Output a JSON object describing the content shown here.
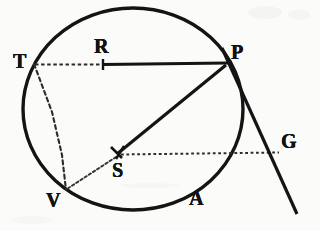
{
  "figure": {
    "kind": "geometry-diagram",
    "caption_text": "",
    "background_color": "#fbfbfa",
    "ink_color": "#121212",
    "canvas": {
      "width": 320,
      "height": 231
    }
  },
  "circle": {
    "name": "main-circle",
    "center_x": 133,
    "center_y": 109,
    "radius_x": 110,
    "radius_y": 101,
    "stroke_width": 3.4,
    "stroke_color": "#141414"
  },
  "points": [
    {
      "id": "T",
      "label": "T",
      "x": 34,
      "y": 64,
      "label_x": 13,
      "label_y": 51,
      "font_size": 20,
      "on_circle": true
    },
    {
      "id": "R",
      "label": "R",
      "x": 103,
      "y": 64,
      "label_x": 94,
      "label_y": 36,
      "font_size": 20,
      "on_circle": false
    },
    {
      "id": "P",
      "label": "P",
      "x": 227,
      "y": 64,
      "label_x": 231,
      "label_y": 42,
      "font_size": 20,
      "on_circle": true
    },
    {
      "id": "S",
      "label": "S",
      "x": 118,
      "y": 155,
      "label_x": 112,
      "label_y": 160,
      "font_size": 20,
      "on_circle": false
    },
    {
      "id": "V",
      "label": "V",
      "x": 66,
      "y": 190,
      "label_x": 46,
      "label_y": 190,
      "font_size": 20,
      "on_circle": true
    },
    {
      "id": "A",
      "label": "A",
      "x": 190,
      "y": 205,
      "label_x": 189,
      "label_y": 188,
      "font_size": 20,
      "on_circle": false
    },
    {
      "id": "G",
      "label": "G",
      "x": 278,
      "y": 152,
      "label_x": 281,
      "label_y": 131,
      "font_size": 20,
      "on_circle": false
    }
  ],
  "segments": [
    {
      "name": "segment-T-R",
      "from": "T",
      "to": "R",
      "style": "dotted",
      "width": 2.0,
      "note": "dotted chord portion from T to tick R"
    },
    {
      "name": "segment-R-P",
      "from": "R",
      "to": "P",
      "style": "solid",
      "width": 3.2,
      "note": "solid heavy line from R to P"
    },
    {
      "name": "segment-P-S",
      "from": "P",
      "to": "S",
      "style": "solid",
      "width": 3.2,
      "note": "solid radius-like line P to S"
    },
    {
      "name": "segment-T-V",
      "from": "T",
      "to": "V",
      "style": "dashed",
      "width": 2.0,
      "note": "dashed chord T to V"
    },
    {
      "name": "segment-S-V",
      "from": "S",
      "to": "V",
      "style": "dotted",
      "width": 1.8,
      "note": "dotted line S to V"
    },
    {
      "name": "segment-S-G",
      "from": "S",
      "to": "G",
      "style": "dotted",
      "width": 1.8,
      "note": "dotted horizontal line S to G"
    },
    {
      "name": "segment-P-G-tangent",
      "from": "P",
      "to": "G",
      "style": "solid",
      "width": 3.2,
      "note": "tangent line through P continuing past G"
    }
  ],
  "tangent_line": {
    "name": "tangent-PG",
    "x1": 222,
    "y1": 48,
    "x2": 297,
    "y2": 214,
    "style": "solid",
    "width": 3.2
  },
  "tick_marks": [
    {
      "name": "tick-R",
      "x": 103,
      "y": 64,
      "length": 9,
      "orientation": "vertical"
    },
    {
      "name": "tick-S",
      "x": 118,
      "y": 155,
      "length": 10,
      "orientation": "cross"
    }
  ],
  "labels_order": [
    "T",
    "R",
    "P",
    "S",
    "V",
    "A",
    "G"
  ]
}
